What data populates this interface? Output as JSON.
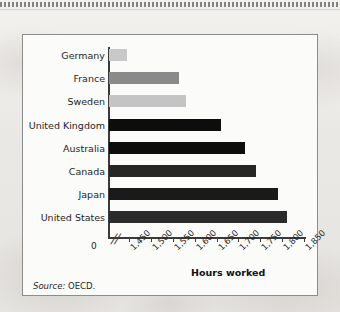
{
  "figure": {
    "source_label": "Source:",
    "source_value": "OECD.",
    "axis_title": "Hours worked",
    "zero_label": "0",
    "break_symbol": "//",
    "frame_border_color": "#8c8c8c",
    "panel_background": "#fbfbfa"
  },
  "chart_data": {
    "type": "bar",
    "orientation": "horizontal",
    "title": "",
    "xlabel": "Hours worked",
    "ylabel": "",
    "categories": [
      "Germany",
      "France",
      "Sweden",
      "United Kingdom",
      "Australia",
      "Canada",
      "Japan",
      "United States"
    ],
    "values": [
      1445,
      1565,
      1580,
      1660,
      1715,
      1740,
      1790,
      1810
    ],
    "bar_colors": [
      "#c8c8c8",
      "#8a8a8a",
      "#c4c4c4",
      "#0d0d0d",
      "#0d0d0d",
      "#262626",
      "#1a1a1a",
      "#2b2b2b"
    ],
    "xlim": [
      1420,
      1860
    ],
    "axis_break": true,
    "axis_break_between": [
      0,
      1450
    ],
    "xticks": [
      1450,
      1500,
      1550,
      1600,
      1650,
      1700,
      1750,
      1800,
      1850
    ],
    "xtick_labels": [
      "1,450",
      "1,500",
      "1,550",
      "1,600",
      "1,650",
      "1,700",
      "1,750",
      "1,800",
      "1,850"
    ],
    "grid": false,
    "legend": null,
    "source": "Source: OECD."
  }
}
